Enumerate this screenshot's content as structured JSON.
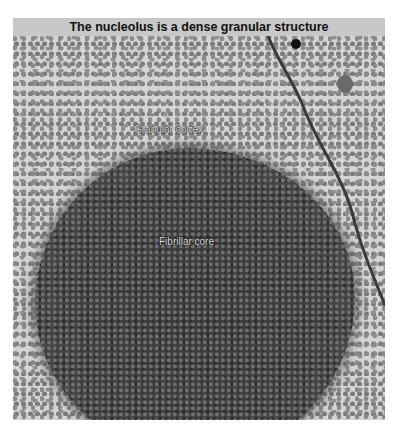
{
  "figure": {
    "title": "The nucleolus is a dense granular structure",
    "labels": {
      "granular_cortex": "Granular cortex",
      "fibrillar_core": "Fibrillar core"
    }
  }
}
